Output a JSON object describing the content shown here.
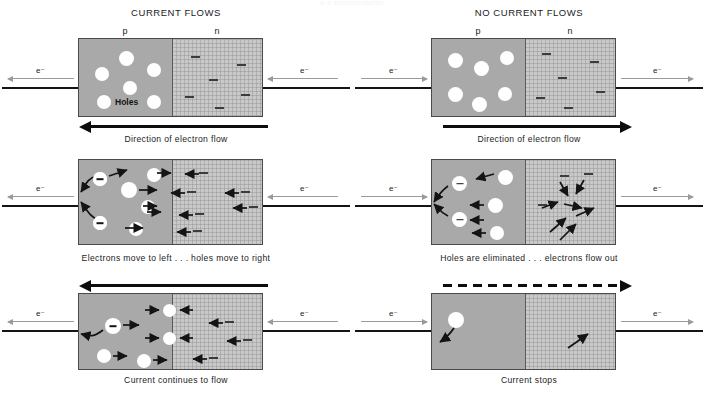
{
  "figure": {
    "ghost_header": "p  n                              semiconductor",
    "columns": [
      {
        "id": "left",
        "title": "CURRENT FLOWS",
        "region_labels": {
          "p": "p",
          "n": "n"
        },
        "terminal_label_left": "e⁻",
        "terminal_label_right": "e⁻",
        "rows": [
          {
            "caption": "Direction of electron flow",
            "bar_position": "below",
            "bar_style": "solid",
            "bar_direction": "left",
            "holes_label": "Holes",
            "p_carriers": 6,
            "n_carriers": 6,
            "left_arrow_dir": "left",
            "right_arrow_dir": "left"
          },
          {
            "caption": "Electrons move to left . . . holes move to right",
            "bar_position": "none",
            "p_carriers": 6,
            "n_carriers": 6,
            "left_arrow_dir": "left",
            "right_arrow_dir": "left"
          },
          {
            "caption": "Current continues to flow",
            "bar_position": "above",
            "bar_style": "solid",
            "bar_direction": "left",
            "p_carriers": 5,
            "n_carriers": 5,
            "left_arrow_dir": "left",
            "right_arrow_dir": "left"
          }
        ]
      },
      {
        "id": "right",
        "title": "NO CURRENT FLOWS",
        "region_labels": {
          "p": "p",
          "n": "n"
        },
        "terminal_label_left": "e⁻",
        "terminal_label_right": "e⁻",
        "rows": [
          {
            "caption": "Direction of electron flow",
            "bar_position": "below",
            "bar_style": "solid",
            "bar_direction": "right",
            "p_carriers": 6,
            "n_carriers": 6,
            "left_arrow_dir": "right",
            "right_arrow_dir": "right"
          },
          {
            "caption": "Holes are eliminated . . . electrons flow out",
            "bar_position": "none",
            "p_carriers": 5,
            "n_carriers": 5,
            "left_arrow_dir": "right",
            "right_arrow_dir": "right"
          },
          {
            "caption": "Current stops",
            "bar_position": "above",
            "bar_style": "dashed",
            "bar_direction": "right",
            "p_carriers": 1,
            "n_carriers": 0,
            "left_arrow_dir": "right",
            "right_arrow_dir": "right"
          }
        ]
      }
    ],
    "colors": {
      "p_region": "#a9a9a9",
      "n_region": "#c9c9c9",
      "hole_fill": "#ffffff",
      "ink": "#141414",
      "gray_arrow": "#9a9a9a",
      "border": "#4a4a4a",
      "background": "#ffffff"
    }
  }
}
